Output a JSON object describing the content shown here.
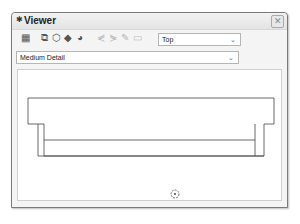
{
  "window": {
    "title": "Viewer",
    "title_icon": "pin-icon",
    "close_label": "✕"
  },
  "toolbar": {
    "icons": [
      {
        "name": "visibility-graphics-icon",
        "glyph": "▦",
        "enabled": true
      },
      {
        "name": "copy-view-icon",
        "glyph": "⧉",
        "enabled": true
      },
      {
        "name": "3d-view-icon",
        "glyph": "⬡",
        "enabled": true
      },
      {
        "name": "shaded-view-icon",
        "glyph": "◆",
        "enabled": true
      },
      {
        "name": "render-icon",
        "glyph": "◕",
        "enabled": true
      },
      {
        "name": "align-left-icon",
        "glyph": "⋞",
        "enabled": false
      },
      {
        "name": "align-right-icon",
        "glyph": "⋟",
        "enabled": false
      },
      {
        "name": "edit-icon",
        "glyph": "✎",
        "enabled": false
      },
      {
        "name": "group-icon",
        "glyph": "▭",
        "enabled": false
      }
    ],
    "view_select": {
      "value": "Top",
      "arrow": "⌄"
    }
  },
  "detail_select": {
    "value": "Medium Detail",
    "arrow": "⌄"
  },
  "canvas": {
    "cursor_icon": "origin-marker-icon"
  }
}
